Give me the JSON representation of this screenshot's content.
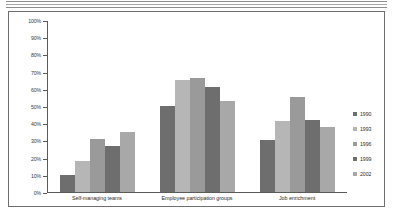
{
  "chart_data": {
    "type": "bar",
    "title": "",
    "subtitle": "",
    "xlabel": "",
    "ylabel": "",
    "ylim": [
      0,
      100
    ],
    "y_tick_labels": [
      "100%",
      "90%",
      "80%",
      "70%",
      "60%",
      "50%",
      "40%",
      "30%",
      "20%",
      "10%",
      "0%"
    ],
    "y_tick_values": [
      100,
      90,
      80,
      70,
      60,
      50,
      40,
      30,
      20,
      10,
      0
    ],
    "grid": false,
    "legend_position": "right",
    "categories": [
      "Self-managing teams",
      "Employee participation groups",
      "Job enrichment"
    ],
    "series": [
      {
        "name": "1990",
        "color": "#6e6e6e",
        "values": [
          10,
          50,
          30
        ]
      },
      {
        "name": "1993",
        "color": "#b6b6b6",
        "values": [
          18,
          65,
          41
        ]
      },
      {
        "name": "1996",
        "color": "#9a9a9a",
        "values": [
          31,
          66,
          55
        ]
      },
      {
        "name": "1999",
        "color": "#6e6e6e",
        "values": [
          27,
          61,
          42
        ]
      },
      {
        "name": "2002",
        "color": "#a8a8a8",
        "values": [
          35,
          53,
          38
        ]
      }
    ]
  },
  "legend": {
    "items": [
      {
        "label": "1990",
        "color": "#6e6e6e"
      },
      {
        "label": "1993",
        "color": "#b6b6b6"
      },
      {
        "label": "1996",
        "color": "#9a9a9a"
      },
      {
        "label": "1999",
        "color": "#6e6e6e"
      },
      {
        "label": "2002",
        "color": "#a8a8a8"
      }
    ]
  }
}
